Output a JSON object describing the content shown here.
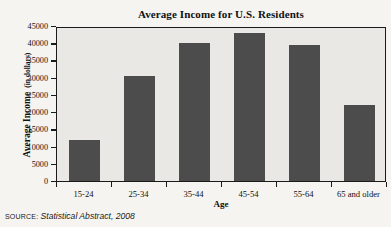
{
  "chart_data": {
    "type": "bar",
    "title": "Average Income for U.S. Residents",
    "xlabel": "Age",
    "ylabel": "Average Income",
    "ylabel_units": "(in dollars)",
    "categories": [
      "15-24",
      "25-34",
      "35-44",
      "45-54",
      "55-64",
      "65 and older"
    ],
    "values": [
      12000,
      30500,
      40000,
      43000,
      39500,
      22000
    ],
    "ylim": [
      0,
      45000
    ],
    "ytick_labels": [
      "45000",
      "40000",
      "35000",
      "30000",
      "25000",
      "20000",
      "15000",
      "10000",
      "5000",
      "0"
    ],
    "ytick_values": [
      45000,
      40000,
      35000,
      30000,
      25000,
      20000,
      15000,
      10000,
      5000,
      0
    ],
    "grid": false,
    "legend": null,
    "bar_color": "#4c4c4c",
    "plot_background": "#e9e8e5",
    "axis_color": "#1a1a1a"
  },
  "source": {
    "label": "SOURCE:",
    "text": "Statistical Abstract, 2008"
  },
  "page": {
    "background": "#f6f4f0"
  }
}
